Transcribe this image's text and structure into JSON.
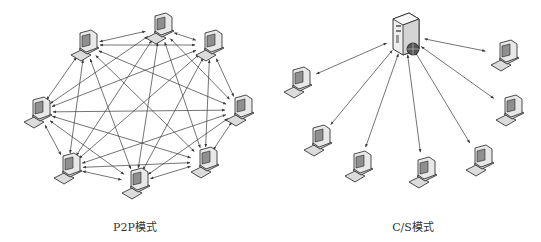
{
  "colors": {
    "line": "#3a3a3a",
    "monitor": "#e6e6e6",
    "screen": "#9a9a9a",
    "outline": "#222222",
    "background": "#ffffff"
  },
  "p2p": {
    "caption": "P2P模式",
    "caption_pos": [
      135,
      225
    ],
    "nodes": [
      {
        "id": "top",
        "x": 160,
        "y": 28,
        "icon": "computer-icon"
      },
      {
        "id": "top-left",
        "x": 85,
        "y": 45,
        "icon": "computer-icon"
      },
      {
        "id": "top-right",
        "x": 210,
        "y": 45,
        "icon": "computer-icon"
      },
      {
        "id": "left",
        "x": 38,
        "y": 112,
        "icon": "computer-icon"
      },
      {
        "id": "right",
        "x": 240,
        "y": 110,
        "icon": "computer-icon"
      },
      {
        "id": "bottom-left",
        "x": 68,
        "y": 168,
        "icon": "computer-icon"
      },
      {
        "id": "bottom-center",
        "x": 136,
        "y": 183,
        "icon": "computer-icon"
      },
      {
        "id": "bottom-right",
        "x": 205,
        "y": 162,
        "icon": "computer-icon"
      }
    ],
    "topology": "full-mesh bidirectional"
  },
  "cs": {
    "caption": "C/S模式",
    "caption_pos": [
      413,
      225
    ],
    "server": {
      "x": 405,
      "y": 35,
      "icon": "server-icon"
    },
    "clients": [
      {
        "id": "c1",
        "x": 298,
        "y": 82,
        "icon": "computer-icon"
      },
      {
        "id": "c2",
        "x": 318,
        "y": 140,
        "icon": "computer-icon"
      },
      {
        "id": "c3",
        "x": 359,
        "y": 166,
        "icon": "computer-icon"
      },
      {
        "id": "c4",
        "x": 423,
        "y": 172,
        "icon": "computer-icon"
      },
      {
        "id": "c5",
        "x": 480,
        "y": 160,
        "icon": "computer-icon"
      },
      {
        "id": "c6",
        "x": 510,
        "y": 110,
        "icon": "computer-icon"
      },
      {
        "id": "c7",
        "x": 505,
        "y": 55,
        "icon": "computer-icon"
      }
    ],
    "topology": "star bidirectional"
  }
}
